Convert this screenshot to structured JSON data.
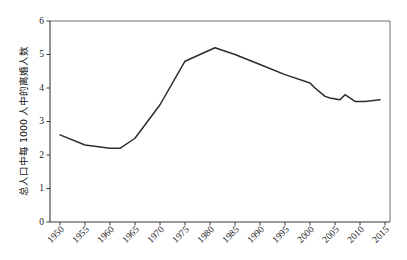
{
  "chart_data": {
    "type": "line",
    "title": "",
    "xlabel": "",
    "ylabel": "总人口中每 1000 人中的离婚人数",
    "xlim": [
      1948,
      2016
    ],
    "ylim": [
      0,
      6
    ],
    "grid": false,
    "legend": false,
    "y_ticks": [
      "0",
      "1",
      "2",
      "3",
      "4",
      "5",
      "6"
    ],
    "y_tick_values": [
      0,
      1,
      2,
      3,
      4,
      5,
      6
    ],
    "x_ticks": [
      "1950",
      "1955",
      "1960",
      "1965",
      "1970",
      "1975",
      "1980",
      "1985",
      "1990",
      "1995",
      "2000",
      "2005",
      "2010",
      "2015"
    ],
    "x_tick_values": [
      1950,
      1955,
      1960,
      1965,
      1970,
      1975,
      1980,
      1985,
      1990,
      1995,
      2000,
      2005,
      2010,
      2015
    ],
    "series": [
      {
        "name": "离婚率",
        "color": "#2c2c2c",
        "x": [
          1950,
          1955,
          1960,
          1962,
          1965,
          1970,
          1975,
          1978,
          1981,
          1985,
          1990,
          1995,
          2000,
          2001,
          2003,
          2004,
          2006,
          2007,
          2009,
          2011,
          2014
        ],
        "values": [
          2.6,
          2.3,
          2.2,
          2.2,
          2.5,
          3.5,
          4.8,
          5.0,
          5.2,
          5.0,
          4.7,
          4.4,
          4.15,
          4.0,
          3.75,
          3.7,
          3.65,
          3.8,
          3.6,
          3.6,
          3.65
        ]
      }
    ]
  },
  "axis": {
    "y_title": "总人口中每 1000 人中的离婚人数"
  }
}
